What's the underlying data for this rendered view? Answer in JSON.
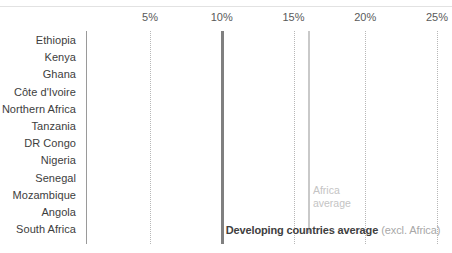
{
  "chart_data": {
    "type": "bar",
    "orientation": "horizontal",
    "title": "",
    "subtitle": "",
    "xlabel": "",
    "ylabel": "",
    "xlim": [
      0,
      25
    ],
    "x_unit": "%",
    "grid": true,
    "legend": "none",
    "tick_labels": [
      "5%",
      "10%",
      "15%",
      "20%",
      "25%"
    ],
    "tick_values": [
      5,
      10,
      15,
      20,
      25
    ],
    "categories": [
      "Ethiopia",
      "Kenya",
      "Ghana",
      "Côte d'Ivoire",
      "Northern Africa",
      "Tanzania",
      "DR Congo",
      "Nigeria",
      "Senegal",
      "Mozambique",
      "Angola",
      "South Africa"
    ],
    "values": [
      23.5,
      22.1,
      21.7,
      20.8,
      20.3,
      17.3,
      16.5,
      15.6,
      15.3,
      13.7,
      11.5,
      10.0
    ],
    "series": [
      {
        "name": "Share",
        "values": [
          23.5,
          22.1,
          21.7,
          20.8,
          20.3,
          17.3,
          16.5,
          15.6,
          15.3,
          13.7,
          11.5,
          10.0
        ]
      }
    ],
    "reference_lines": [
      {
        "name": "developing-countries-average",
        "value": 10.0,
        "label": "Developing countries average",
        "label_secondary": "(excl. Africa)",
        "color": "#808080"
      },
      {
        "name": "africa-average",
        "value": 16.0,
        "label_line1": "Africa",
        "label_line2": "average",
        "color": "#c9c9c9"
      }
    ]
  },
  "annotations": {
    "africa_line1": "Africa",
    "africa_line2": "average",
    "developing_strong": "Developing countries average",
    "developing_muted": "(excl. Africa)"
  },
  "colors": {
    "bar": "#a6a6a6",
    "grid": "#b7b7b7",
    "axis": "#9a9a9a",
    "dev_line": "#808080",
    "africa_line": "#c9c9c9",
    "label_text": "#3d3d3d",
    "tick_text": "#5a5a5a",
    "background": "#ffffff"
  }
}
